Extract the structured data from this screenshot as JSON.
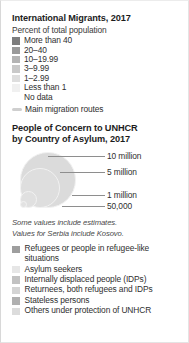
{
  "panel": {
    "background": "#ffffff",
    "border_color": "#d8d8d8"
  },
  "migrants_section": {
    "title": "International Migrants, 2017",
    "subtitle": "Percent of total population",
    "classes": [
      {
        "label": "More than 40",
        "color": "#7d7d7d"
      },
      {
        "label": "20–40",
        "color": "#9a9a9a"
      },
      {
        "label": "10–19.99",
        "color": "#b4b4b4"
      },
      {
        "label": "3–9.99",
        "color": "#c9c9c9"
      },
      {
        "label": "1–2.99",
        "color": "#dedede"
      },
      {
        "label": "Less than 1",
        "color": "#f0f0f0"
      },
      {
        "label": "No data",
        "color": "#ffffff"
      }
    ],
    "route": {
      "label": "Main migration routes",
      "color": "#cfcfcf"
    }
  },
  "unhcr_section": {
    "title_line1": "People of Concern to UNHCR",
    "title_line2": "by Country of Asylum, 2017",
    "bubbles": [
      {
        "label": "10 million",
        "size_px": 56,
        "color": "#dbdbdb"
      },
      {
        "label": "5 million",
        "size_px": 40,
        "color": "#dedede"
      },
      {
        "label": "1 million",
        "size_px": 17,
        "color": "#e0e0e0"
      },
      {
        "label": "50,000",
        "size_px": 7,
        "color": "#e2e2e2"
      }
    ],
    "notes": [
      "Some values include estimates.",
      "Values for Serbia include Kosovo."
    ],
    "categories": [
      {
        "label": "Refugees or people in refugee-like situations",
        "color": "#9e9e9e"
      },
      {
        "label": "Asylum seekers",
        "color": "#e6e6e6"
      },
      {
        "label": "Internally displaced people (IDPs)",
        "color": "#c2c2c2"
      },
      {
        "label": "Returnees, both refugees and IDPs",
        "color": "#d4d4d4"
      },
      {
        "label": "Stateless persons",
        "color": "#b0b0b0"
      },
      {
        "label": "Others under protection of UNHCR",
        "color": "#dcdcdc"
      }
    ]
  }
}
